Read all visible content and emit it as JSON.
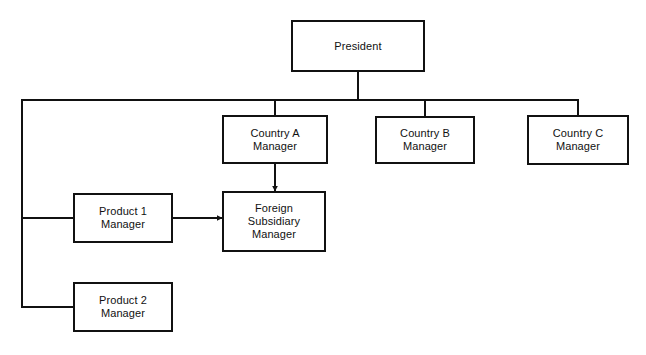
{
  "diagram": {
    "type": "org-chart",
    "background_color": "#ffffff",
    "line_color": "#111111",
    "box_fill": "#ffffff",
    "text_color": "#111111",
    "nodes": [
      {
        "id": "president",
        "label": "President",
        "x": 291,
        "y": 20,
        "w": 134,
        "h": 52,
        "stroke_width": 2
      },
      {
        "id": "country_a",
        "label": "Country A\nManager",
        "x": 222,
        "y": 115,
        "w": 106,
        "h": 49,
        "stroke_width": 2
      },
      {
        "id": "country_b",
        "label": "Country B\nManager",
        "x": 375,
        "y": 116,
        "w": 100,
        "h": 48,
        "stroke_width": 2
      },
      {
        "id": "country_c",
        "label": "Country C\nManager",
        "x": 527,
        "y": 115,
        "w": 102,
        "h": 50,
        "stroke_width": 2
      },
      {
        "id": "product_1",
        "label": "Product 1\nManager",
        "x": 73,
        "y": 193,
        "w": 100,
        "h": 50,
        "stroke_width": 2
      },
      {
        "id": "foreign_subsidiary",
        "label": "Foreign\nSubsidiary\nManager",
        "x": 222,
        "y": 191,
        "w": 104,
        "h": 61,
        "stroke_width": 2
      },
      {
        "id": "product_2",
        "label": "Product 2\nManager",
        "x": 73,
        "y": 282,
        "w": 100,
        "h": 50,
        "stroke_width": 2
      }
    ],
    "connectors": [
      {
        "id": "president-drop",
        "kind": "line",
        "points": "358,72 358,100",
        "arrow": false
      },
      {
        "id": "horizontal-bus",
        "kind": "line",
        "points": "22,100 578,100",
        "arrow": false
      },
      {
        "id": "bus-to-country-a",
        "kind": "line",
        "points": "275,100 275,115",
        "arrow": false
      },
      {
        "id": "bus-to-country-b",
        "kind": "line",
        "points": "425,100 425,116",
        "arrow": false
      },
      {
        "id": "bus-to-country-c",
        "kind": "line",
        "points": "578,100 578,115",
        "arrow": false
      },
      {
        "id": "left-trunk",
        "kind": "line",
        "points": "22,100 22,307",
        "arrow": false
      },
      {
        "id": "trunk-to-product-1",
        "kind": "line",
        "points": "22,218 73,218",
        "arrow": false
      },
      {
        "id": "trunk-to-product-2",
        "kind": "line",
        "points": "22,307 73,307",
        "arrow": false
      },
      {
        "id": "country-a-to-foreign-subsidiary",
        "kind": "arrow",
        "points": "275,164 275,191",
        "arrow": true,
        "direction": "down"
      },
      {
        "id": "product-1-to-foreign-subsidiary",
        "kind": "arrow",
        "points": "173,218 222,218",
        "arrow": true,
        "direction": "right"
      }
    ]
  }
}
